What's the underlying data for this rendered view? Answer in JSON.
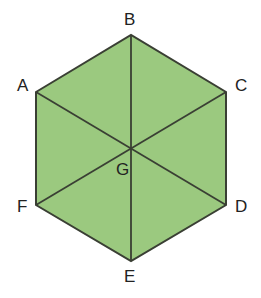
{
  "diagram": {
    "shape": "regular hexagon divided into 6 triangles",
    "fill_color": "#9bc97f",
    "stroke_color": "#3a3f34",
    "vertices": [
      {
        "name": "A",
        "x": 36,
        "y": 92
      },
      {
        "name": "B",
        "x": 131,
        "y": 35
      },
      {
        "name": "C",
        "x": 226,
        "y": 92
      },
      {
        "name": "D",
        "x": 226,
        "y": 205
      },
      {
        "name": "E",
        "x": 131,
        "y": 261
      },
      {
        "name": "F",
        "x": 36,
        "y": 205
      }
    ],
    "center": {
      "name": "G",
      "x": 131,
      "y": 148
    },
    "labels": {
      "A": "A",
      "B": "B",
      "C": "C",
      "D": "D",
      "E": "E",
      "F": "F",
      "G": "G"
    }
  }
}
